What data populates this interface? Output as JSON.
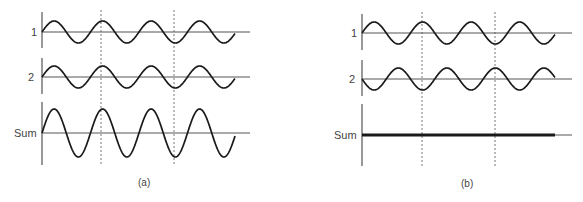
{
  "figure": {
    "panels": [
      {
        "id": "a",
        "caption": "(a)",
        "description": "Constructive interference: waves 1 and 2 in phase",
        "traces": [
          {
            "label": "1",
            "type": "sine",
            "phase": 0,
            "amplitude": 11
          },
          {
            "label": "2",
            "type": "sine",
            "phase": 0,
            "amplitude": 11
          },
          {
            "label": "Sum",
            "type": "sine",
            "phase": 0,
            "amplitude": 24
          }
        ]
      },
      {
        "id": "b",
        "caption": "(b)",
        "description": "Destructive interference: waves 1 and 2 out of phase",
        "traces": [
          {
            "label": "1",
            "type": "sine",
            "phase": 0,
            "amplitude": 11
          },
          {
            "label": "2",
            "type": "sine",
            "phase": 180,
            "amplitude": 11
          },
          {
            "label": "Sum",
            "type": "flat",
            "phase": 0,
            "amplitude": 0
          }
        ]
      }
    ],
    "colors": {
      "wave": "#1a1a1a",
      "axis": "#555555",
      "guide": "#777777"
    }
  }
}
